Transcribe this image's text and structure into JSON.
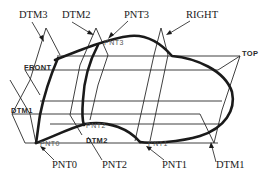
{
  "diagram": {
    "type": "cad-wireframe",
    "callouts": {
      "dtm3": "DTM3",
      "dtm2": "DTM2",
      "pnt3": "PNT3",
      "right": "RIGHT",
      "pnt0": "PNT0",
      "pnt2": "PNT2",
      "pnt1": "PNT1",
      "dtm1": "DTM1"
    },
    "plane_tags": {
      "top": "TOP",
      "front": "FRONT",
      "dtm1": "DTM1",
      "dtm2": "DTM2"
    },
    "point_tags": {
      "pnt0": "PNT0",
      "pnt1": "PNT1",
      "pnt2": "PNT2",
      "pnt3": "PNT3"
    },
    "colors": {
      "line": "#1a1a1a",
      "background": "#ffffff",
      "point_label": "#555555"
    }
  }
}
